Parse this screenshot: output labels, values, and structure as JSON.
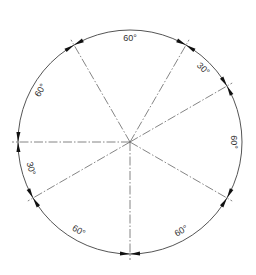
{
  "diagram": {
    "type": "angular-dimension-circle",
    "center": [
      130,
      142
    ],
    "radius": 112,
    "line_color": "#555555",
    "arrow_color": "#111111",
    "rays_deg": [
      120,
      60,
      30,
      -30,
      -90,
      210,
      180
    ],
    "arcs": [
      {
        "from": 120,
        "to": 60,
        "label": "60°"
      },
      {
        "from": 60,
        "to": 30,
        "label": "30°"
      },
      {
        "from": 30,
        "to": -30,
        "label": "60°"
      },
      {
        "from": -30,
        "to": -90,
        "label": "60°"
      },
      {
        "from": -90,
        "to": -150,
        "label": "60°"
      },
      {
        "from": 210,
        "to": 180,
        "label": "30°"
      },
      {
        "from": 180,
        "to": 120,
        "label": "60°"
      }
    ]
  }
}
